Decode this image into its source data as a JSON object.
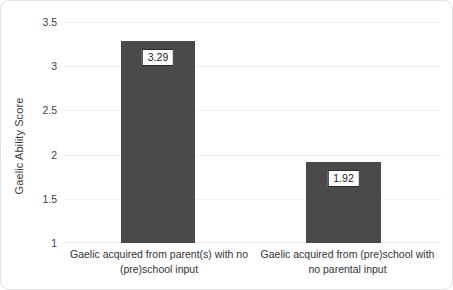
{
  "chart_data": {
    "type": "bar",
    "title": "",
    "xlabel": "",
    "ylabel": "Gaelic Ability Score",
    "ylim": [
      1,
      3.5
    ],
    "grid": true,
    "legend": false,
    "categories": [
      "Gaelic acquired from parent(s) with no (pre)school input",
      "Gaelic acquired from (pre)school with no parental input"
    ],
    "values": [
      3.29,
      1.92
    ],
    "value_labels": [
      "3.29",
      "1.92"
    ],
    "ytick_labels": [
      "3.5",
      "3",
      "2.5",
      "2",
      "1.5",
      "1"
    ],
    "ytick_values": [
      3.5,
      3,
      2.5,
      2,
      1.5,
      1
    ],
    "colors": {
      "bar": "#4a4a4a",
      "gridline": "#f1f1f1",
      "label_box_fill": "#ffffff",
      "label_box_border": "#2b2b2b",
      "text": "#333333",
      "card_border": "#e2e2e2",
      "background": "#ffffff"
    }
  }
}
